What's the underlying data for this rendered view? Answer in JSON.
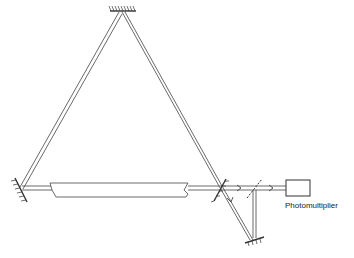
{
  "diagram": {
    "labels": {
      "photomultiplier": "Photomultiplier"
    },
    "components": [
      {
        "name": "top-mirror",
        "type": "mirror"
      },
      {
        "name": "left-mirror",
        "type": "mirror"
      },
      {
        "name": "right-partial-mirror",
        "type": "mirror"
      },
      {
        "name": "gain-tube",
        "type": "laser-tube"
      },
      {
        "name": "beam-splitter",
        "type": "beam-splitter"
      },
      {
        "name": "bottom-mirror",
        "type": "mirror"
      },
      {
        "name": "photomultiplier",
        "type": "detector"
      }
    ],
    "colors": {
      "line": "#333333",
      "background": "#ffffff"
    }
  }
}
